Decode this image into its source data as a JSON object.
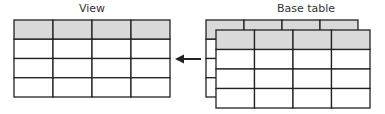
{
  "view": {
    "title": "View",
    "columns": 4,
    "header_rows": 1,
    "body_rows": 3
  },
  "base_table": {
    "title": "Base table",
    "columns": 4,
    "header_rows": 1,
    "body_rows": 3,
    "stacked_layers": 2
  },
  "arrow": {
    "direction": "left",
    "from": "base_table",
    "to": "view"
  },
  "colors": {
    "header_fill": "#d9d9d9",
    "line": "#222222",
    "cell_fill": "#ffffff"
  }
}
